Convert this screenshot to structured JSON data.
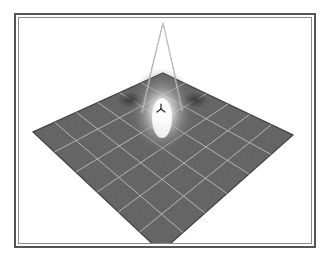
{
  "figure": {
    "colors": {
      "plane": "#5e5e5e",
      "plane_edge": "#3a3a3a",
      "grid": "#d8d8d8",
      "highlight": "#ffffff",
      "cone": "#9a9a9a",
      "frame": "#555555"
    },
    "plane_corners": {
      "top": [
        163,
        73
      ],
      "left": [
        33,
        132
      ],
      "right": [
        293,
        135
      ],
      "bottom": [
        161,
        252
      ]
    },
    "grid_divisions": 6,
    "spotlight": {
      "apex": [
        163,
        23
      ],
      "left_foot": [
        141,
        113
      ],
      "right_foot": [
        183,
        111
      ]
    },
    "light_glyph": {
      "position": [
        161,
        109
      ],
      "icon": "tri-axis-light-icon"
    }
  }
}
